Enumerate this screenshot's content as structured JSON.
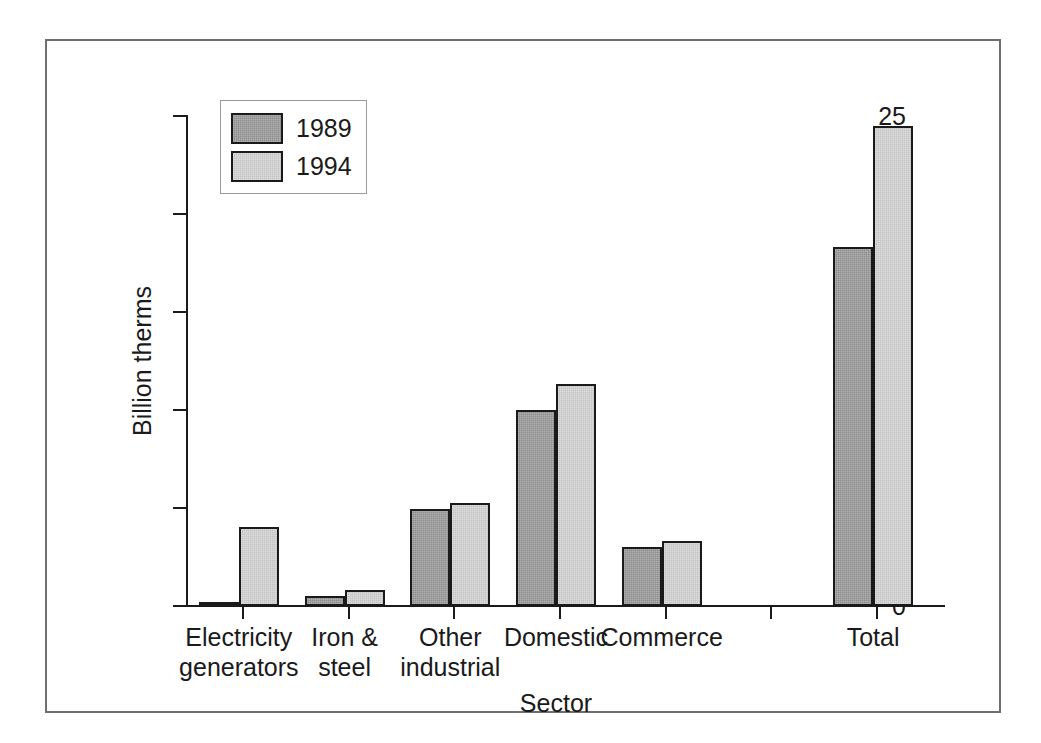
{
  "chart_data": {
    "type": "bar",
    "title": "",
    "xlabel": "Sector",
    "ylabel": "Billion therms",
    "ylim": [
      0,
      25
    ],
    "yticks": [
      0,
      5,
      10,
      15,
      20,
      25
    ],
    "ytick_labels": [
      "0",
      "5",
      "10",
      "15",
      "20",
      "25"
    ],
    "grid": false,
    "legend_position": "top-left",
    "categories": [
      "Electricity\ngenerators",
      "Iron &\nsteel",
      "Other\nindustrial",
      "Domestic",
      "Commerce",
      "",
      "Total"
    ],
    "series": [
      {
        "name": "1989",
        "color": "#8d8d8d",
        "values": [
          0.2,
          0.5,
          4.95,
          10.0,
          3.0,
          null,
          18.3
        ]
      },
      {
        "name": "1994",
        "color": "#c4c4c4",
        "values": [
          4.05,
          0.8,
          5.25,
          11.35,
          3.3,
          null,
          24.5
        ]
      }
    ]
  },
  "legend": {
    "entries": [
      {
        "label": "1989",
        "color": "#8d8d8d"
      },
      {
        "label": "1994",
        "color": "#c4c4c4"
      }
    ]
  },
  "colors": {
    "series_1989": "#8d8d8d",
    "series_1994": "#c4c4c4",
    "axis": "#1a1a1a",
    "frame": "#6e6e6e",
    "background": "#ffffff"
  }
}
